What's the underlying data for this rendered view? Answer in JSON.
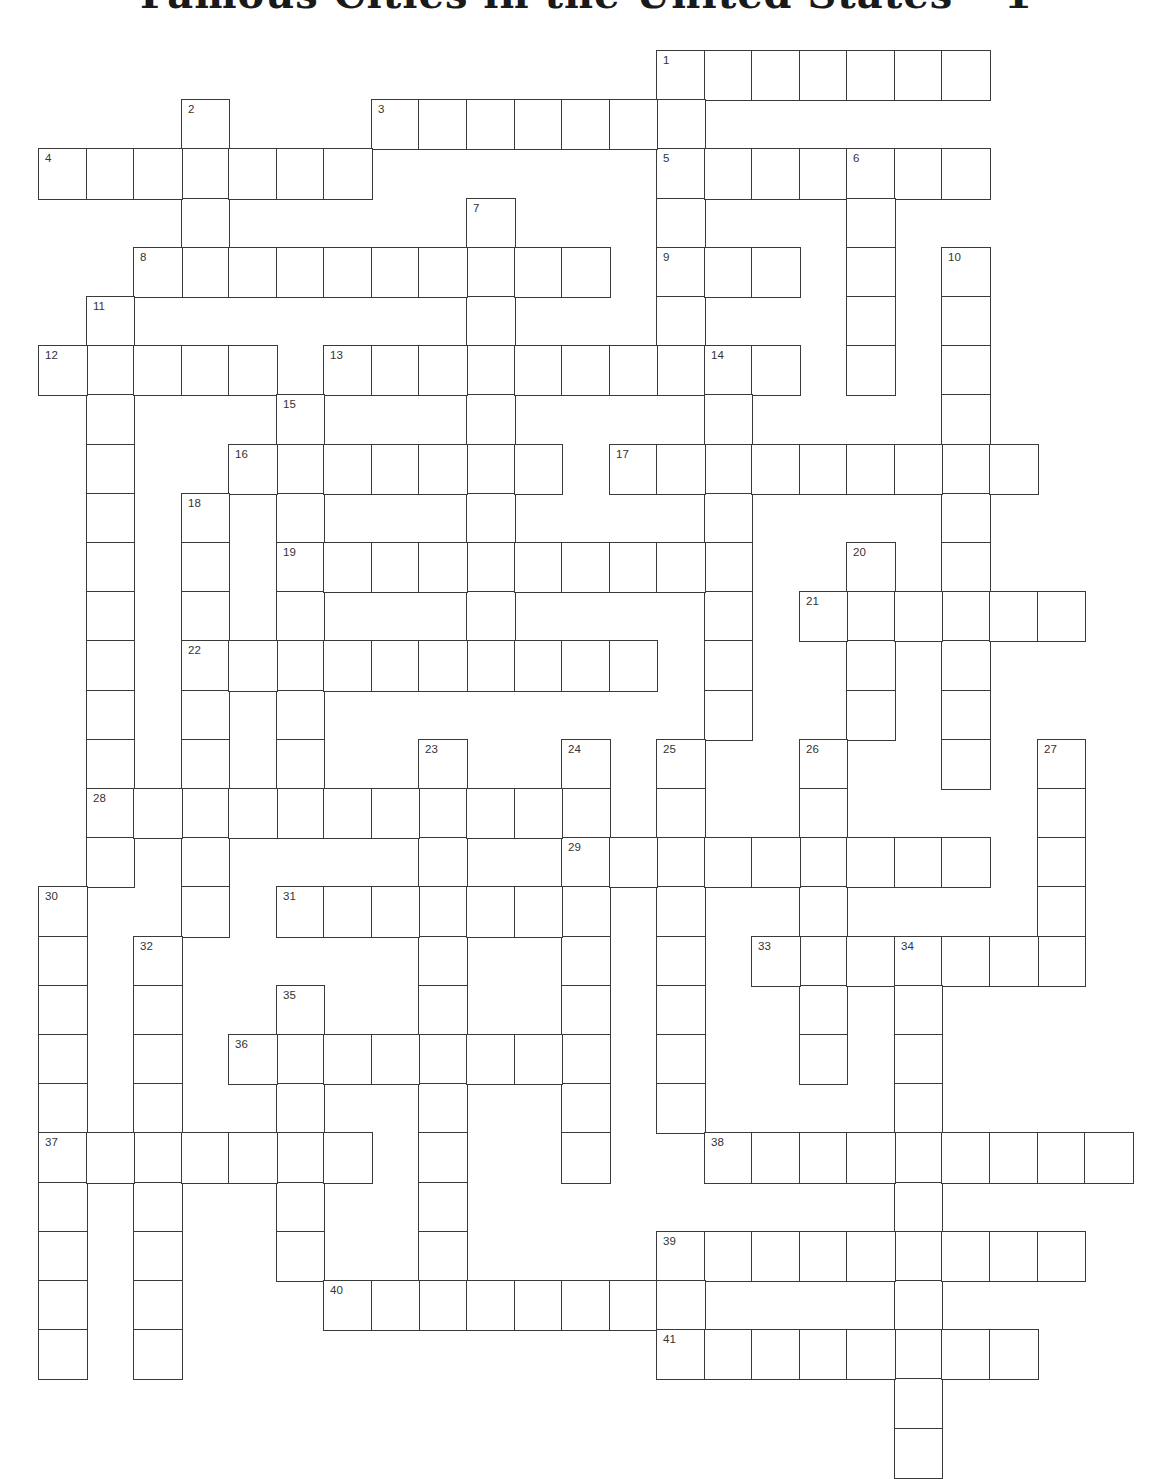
{
  "title": "Famous Cities in the United States – 1",
  "grid": {
    "origin_x": 38,
    "origin_y": 50,
    "cell_w": 47.55,
    "cell_h": 49.2,
    "border_color": "#3a3a3a",
    "number_color": "#333333"
  },
  "entries": [
    {
      "num": 1,
      "dir": "across",
      "row": 0,
      "col": 13,
      "len": 7
    },
    {
      "num": 1,
      "dir": "down",
      "row": 0,
      "col": 13,
      "len": 7
    },
    {
      "num": 2,
      "dir": "down",
      "row": 1,
      "col": 3,
      "len": 4
    },
    {
      "num": 3,
      "dir": "across",
      "row": 1,
      "col": 7,
      "len": 7
    },
    {
      "num": 4,
      "dir": "across",
      "row": 2,
      "col": 0,
      "len": 7
    },
    {
      "num": 5,
      "dir": "across",
      "row": 2,
      "col": 13,
      "len": 7
    },
    {
      "num": 6,
      "dir": "down",
      "row": 2,
      "col": 17,
      "len": 5
    },
    {
      "num": 7,
      "dir": "down",
      "row": 3,
      "col": 9,
      "len": 10
    },
    {
      "num": 8,
      "dir": "across",
      "row": 4,
      "col": 2,
      "len": 10
    },
    {
      "num": 9,
      "dir": "across",
      "row": 4,
      "col": 13,
      "len": 3
    },
    {
      "num": 10,
      "dir": "down",
      "row": 4,
      "col": 19,
      "len": 11
    },
    {
      "num": 11,
      "dir": "down",
      "row": 5,
      "col": 1,
      "len": 12
    },
    {
      "num": 12,
      "dir": "across",
      "row": 6,
      "col": 0,
      "len": 5
    },
    {
      "num": 13,
      "dir": "across",
      "row": 6,
      "col": 6,
      "len": 10
    },
    {
      "num": 14,
      "dir": "down",
      "row": 6,
      "col": 14,
      "len": 8
    },
    {
      "num": 15,
      "dir": "down",
      "row": 7,
      "col": 5,
      "len": 9
    },
    {
      "num": 16,
      "dir": "across",
      "row": 8,
      "col": 4,
      "len": 7
    },
    {
      "num": 17,
      "dir": "across",
      "row": 8,
      "col": 12,
      "len": 9
    },
    {
      "num": 18,
      "dir": "down",
      "row": 9,
      "col": 3,
      "len": 9
    },
    {
      "num": 19,
      "dir": "across",
      "row": 10,
      "col": 5,
      "len": 10
    },
    {
      "num": 20,
      "dir": "down",
      "row": 10,
      "col": 17,
      "len": 4
    },
    {
      "num": 21,
      "dir": "across",
      "row": 11,
      "col": 16,
      "len": 6
    },
    {
      "num": 22,
      "dir": "across",
      "row": 12,
      "col": 3,
      "len": 10
    },
    {
      "num": 23,
      "dir": "down",
      "row": 14,
      "col": 8,
      "len": 12
    },
    {
      "num": 24,
      "dir": "down",
      "row": 14,
      "col": 11,
      "len": 9
    },
    {
      "num": 25,
      "dir": "down",
      "row": 14,
      "col": 13,
      "len": 8
    },
    {
      "num": 26,
      "dir": "down",
      "row": 14,
      "col": 16,
      "len": 7
    },
    {
      "num": 27,
      "dir": "down",
      "row": 14,
      "col": 21,
      "len": 5
    },
    {
      "num": 28,
      "dir": "across",
      "row": 15,
      "col": 1,
      "len": 11
    },
    {
      "num": 29,
      "dir": "across",
      "row": 16,
      "col": 11,
      "len": 9
    },
    {
      "num": 30,
      "dir": "down",
      "row": 17,
      "col": 0,
      "len": 10
    },
    {
      "num": 31,
      "dir": "across",
      "row": 17,
      "col": 5,
      "len": 7
    },
    {
      "num": 32,
      "dir": "down",
      "row": 18,
      "col": 2,
      "len": 9
    },
    {
      "num": 33,
      "dir": "across",
      "row": 18,
      "col": 15,
      "len": 7
    },
    {
      "num": 34,
      "dir": "down",
      "row": 18,
      "col": 18,
      "len": 11
    },
    {
      "num": 35,
      "dir": "down",
      "row": 19,
      "col": 5,
      "len": 6
    },
    {
      "num": 36,
      "dir": "across",
      "row": 20,
      "col": 4,
      "len": 8
    },
    {
      "num": 37,
      "dir": "across",
      "row": 22,
      "col": 0,
      "len": 7
    },
    {
      "num": 38,
      "dir": "across",
      "row": 22,
      "col": 14,
      "len": 9
    },
    {
      "num": 39,
      "dir": "across",
      "row": 24,
      "col": 13,
      "len": 9
    },
    {
      "num": 40,
      "dir": "across",
      "row": 25,
      "col": 6,
      "len": 8
    },
    {
      "num": 41,
      "dir": "across",
      "row": 26,
      "col": 13,
      "len": 8
    }
  ]
}
